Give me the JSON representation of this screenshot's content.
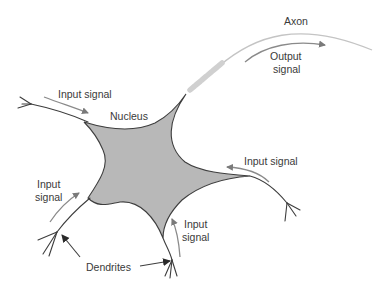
{
  "diagram": {
    "type": "neuron-structure",
    "colors": {
      "soma_fill": "#b8b8b8",
      "outline": "#3d3d3d",
      "axon": "#c4c4c4",
      "myelin": "#d0d0d0",
      "signal_arrow": "#8a8a8a",
      "pointer_arrow": "#2a2a2a",
      "text": "#3a3a3a"
    },
    "labels": {
      "axon": "Axon",
      "output_signal_line1": "Output",
      "output_signal_line2": "signal",
      "nucleus": "Nucleus",
      "input_signal_top_left": "Input signal",
      "input_signal_right": "Input signal",
      "input_signal_left_line1": "Input",
      "input_signal_left_line2": "signal",
      "input_signal_bottom_line1": "Input",
      "input_signal_bottom_line2": "signal",
      "dendrites": "Dendrites"
    }
  }
}
